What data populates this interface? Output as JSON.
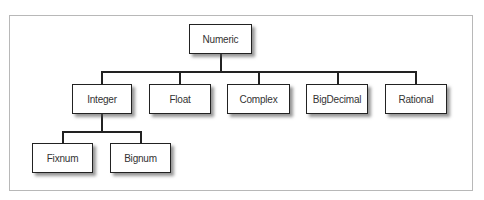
{
  "diagram": {
    "type": "class-hierarchy-tree",
    "root": {
      "label": "Numeric",
      "children": [
        {
          "label": "Integer",
          "children": [
            {
              "label": "Fixnum"
            },
            {
              "label": "Bignum"
            }
          ]
        },
        {
          "label": "Float"
        },
        {
          "label": "Complex"
        },
        {
          "label": "BigDecimal"
        },
        {
          "label": "Rational"
        }
      ]
    },
    "nodes": {
      "numeric": "Numeric",
      "integer": "Integer",
      "float": "Float",
      "complex": "Complex",
      "bigdecimal": "BigDecimal",
      "rational": "Rational",
      "fixnum": "Fixnum",
      "bignum": "Bignum"
    },
    "colors": {
      "border": "#222222",
      "text": "#333333",
      "frame": "#b8b8b8",
      "background": "#ffffff"
    }
  }
}
